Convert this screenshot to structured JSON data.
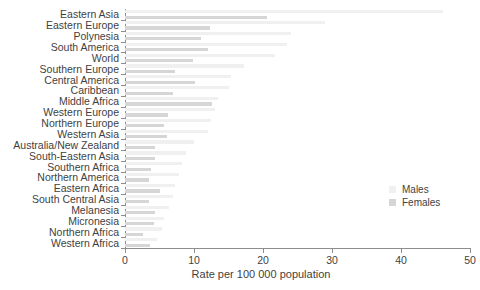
{
  "chart_data": {
    "type": "bar",
    "orientation": "horizontal",
    "title": "",
    "xlabel": "Rate per 100 000 population",
    "ylabel": "",
    "xlim": [
      0,
      50
    ],
    "xticks": [
      0,
      10,
      20,
      30,
      40,
      50
    ],
    "grid": false,
    "legend_position": "right-inside",
    "categories": [
      "Eastern Asia",
      "Eastern Europe",
      "Polynesia",
      "South America",
      "World",
      "Southern Europe",
      "Central America",
      "Caribbean",
      "Middle Africa",
      "Western Europe",
      "Northern Europe",
      "Western Asia",
      "Australia/New Zealand",
      "South-Eastern Asia",
      "Southern Africa",
      "Northern America",
      "Eastern Africa",
      "South Central Asia",
      "Melanesia",
      "Micronesia",
      "Northern Africa",
      "Western Africa"
    ],
    "series": [
      {
        "name": "Males",
        "color": "#f0f0f0",
        "values": [
          46.1,
          29.0,
          24.1,
          23.5,
          21.8,
          17.2,
          15.3,
          15.0,
          13.5,
          13.1,
          12.4,
          12.1,
          10.0,
          8.9,
          8.2,
          7.8,
          7.3,
          6.9,
          6.4,
          5.7,
          5.3,
          4.6
        ]
      },
      {
        "name": "Females",
        "color": "#d6d6d6",
        "values": [
          20.6,
          12.3,
          11.0,
          12.1,
          9.9,
          7.3,
          10.1,
          7.0,
          12.6,
          6.2,
          5.6,
          6.1,
          4.3,
          4.4,
          3.7,
          3.5,
          5.1,
          3.5,
          4.4,
          4.2,
          2.6,
          3.6
        ]
      }
    ]
  },
  "legend": {
    "items": [
      {
        "label": "Males",
        "color": "#f0f0f0"
      },
      {
        "label": "Females",
        "color": "#d6d6d6"
      }
    ]
  }
}
